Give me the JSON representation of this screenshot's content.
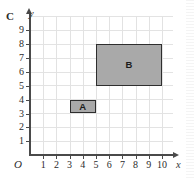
{
  "figure": {
    "label": "C",
    "x_axis_name": "x",
    "y_axis_name": "y",
    "origin_label": "O"
  },
  "chart_data": {
    "type": "scatter",
    "title": "C",
    "xlabel": "x",
    "ylabel": "y",
    "xlim": [
      0,
      10
    ],
    "ylim": [
      0,
      10
    ],
    "grid": true,
    "legend": "none",
    "x_ticks": [
      1,
      2,
      3,
      4,
      5,
      6,
      7,
      8,
      9,
      10
    ],
    "y_ticks": [
      1,
      2,
      3,
      4,
      5,
      6,
      7,
      8,
      9
    ],
    "shapes": [
      {
        "label": "A",
        "type": "rectangle",
        "x0": 3,
        "y0": 3,
        "x1": 5,
        "y1": 4,
        "width": 2,
        "height": 1,
        "fill": "#a9a9a9",
        "stroke": "#2e2e2e"
      },
      {
        "label": "B",
        "type": "rectangle",
        "x0": 5,
        "y0": 5,
        "x1": 10,
        "y1": 8,
        "width": 5,
        "height": 3,
        "fill": "#a9a9a9",
        "stroke": "#2e2e2e"
      }
    ]
  },
  "colors": {
    "grid": "#e2e2e2",
    "axis": "#4a4a4a",
    "shape_fill": "#a9a9a9",
    "shape_stroke": "#2e2e2e"
  }
}
